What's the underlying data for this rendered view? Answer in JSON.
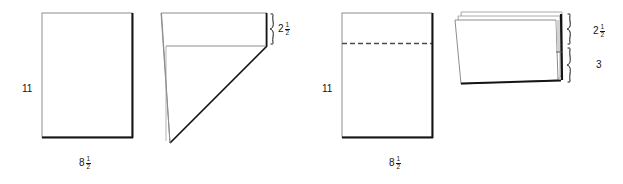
{
  "figure": {
    "background_color": "#ffffff",
    "line_color": "#7a7a7a",
    "edge_shadow_color": "#141414",
    "text_color": "#141414"
  },
  "panels": [
    {
      "id": "panel-left",
      "sheet": {
        "name": "flat-sheet",
        "height_label": "11",
        "width_label_whole": "8",
        "width_label_numerator": "1",
        "width_label_denominator": "2"
      },
      "folded": {
        "name": "triangle-fold",
        "brace_label_whole": "2",
        "brace_label_numerator": "1",
        "brace_label_denominator": "2"
      }
    },
    {
      "id": "panel-right",
      "sheet": {
        "name": "creased-sheet",
        "height_label": "11",
        "width_label_whole": "8",
        "width_label_numerator": "1",
        "width_label_denominator": "2",
        "crease": "dashed-horizontal"
      },
      "folded": {
        "name": "stacked-fold",
        "brace_top_whole": "2",
        "brace_top_numerator": "1",
        "brace_top_denominator": "2",
        "brace_bottom_label": "3"
      }
    }
  ]
}
